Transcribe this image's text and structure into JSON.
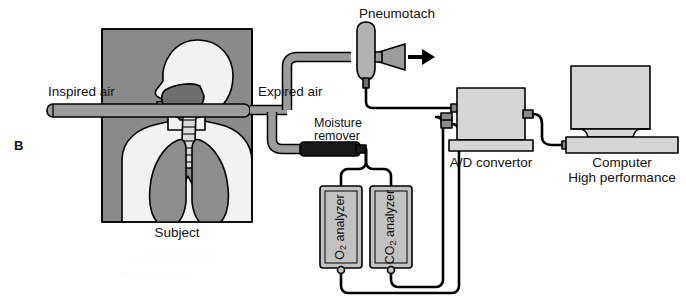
{
  "figure": {
    "panel_letter": "B",
    "title_implicit": "Open-circuit metabolic measurement system"
  },
  "labels": {
    "inspired_air": "Inspired air",
    "expired_air": "Expired air",
    "pneumotach": "Pneumotach",
    "moisture_remover_line1": "Moisture",
    "moisture_remover_line2": "remover",
    "o2_analyzer_main": "O",
    "o2_analyzer_sub": "2",
    "o2_analyzer_tail": " analyzer",
    "co2_analyzer_main": "CO",
    "co2_analyzer_sub": "2",
    "co2_analyzer_tail": " analyzer",
    "ad_convertor": "A/D convertor",
    "computer_line1": "Computer",
    "computer_line2": "High performance",
    "subject": "Subject"
  },
  "components": [
    {
      "id": "subject-panel",
      "name": "Subject",
      "kind": "illustration-panel"
    },
    {
      "id": "mouthpiece-tube",
      "name": "Inspired air tube",
      "kind": "tube"
    },
    {
      "id": "expired-tube",
      "name": "Expired air tube",
      "kind": "tube"
    },
    {
      "id": "pneumotach",
      "name": "Pneumotach",
      "kind": "flow-transducer"
    },
    {
      "id": "moisture-remover",
      "name": "Moisture remover",
      "kind": "drying-column"
    },
    {
      "id": "o2-analyzer",
      "name": "O2 analyzer",
      "kind": "gas-analyzer"
    },
    {
      "id": "co2-analyzer",
      "name": "CO2 analyzer",
      "kind": "gas-analyzer"
    },
    {
      "id": "ad-convertor",
      "name": "A/D convertor",
      "kind": "instrument"
    },
    {
      "id": "computer",
      "name": "Computer High performance",
      "kind": "computer"
    }
  ],
  "flow": {
    "arrow_direction": "right",
    "arrow_meaning": "exhaust airflow out of pneumotach"
  },
  "colors": {
    "page_background": "#ffffff",
    "panel_background": "#8a8a8a",
    "body_light": "#f2f2f2",
    "lung_gray": "#8e8e8e",
    "airway_gray": "#6e6e6e",
    "equipment_fill": "#d5d5d5",
    "equipment_fill_dark": "#c2c2c2",
    "tube_fill": "#9c9c9c",
    "moisture_remover_fill": "#1a1a1a",
    "outline": "#000000",
    "text": "#111111"
  }
}
